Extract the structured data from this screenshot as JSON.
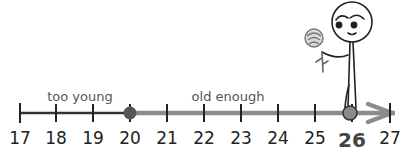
{
  "number_line": {
    "ticks": [
      "17",
      "18",
      "19",
      "20",
      "21",
      "22",
      "23",
      "24",
      "25",
      "26",
      "27"
    ],
    "highlighted_value": "26",
    "threshold_value": "20"
  },
  "regions": {
    "too_young": "too young",
    "old_enough": "old enough"
  },
  "figure": {
    "character": "stick-figure",
    "holding": "rose"
  },
  "colors": {
    "base_line": "#333333",
    "highlight_line": "#8c8c8c",
    "threshold_dot": "#555555",
    "position_dot": "#8a8a8a"
  }
}
